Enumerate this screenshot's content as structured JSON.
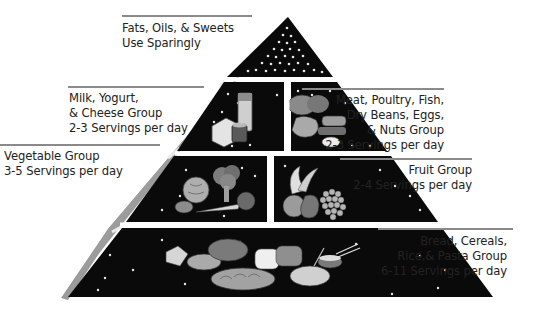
{
  "colors": {
    "tier_fill": "#0a0a0a",
    "side_face": "#9a9a9a",
    "divider": "#e9e9e9",
    "rule_line": "#8a8a8a",
    "text": "#222222",
    "speckle": "#e8e8e8"
  },
  "groups": [
    {
      "id": "fats",
      "tier": 1,
      "side": "left",
      "lines": [
        "Fats, Oils, & Sweets",
        "Use Sparingly"
      ]
    },
    {
      "id": "milk",
      "tier": 2,
      "side": "left",
      "lines": [
        "Milk, Yogurt,",
        "& Cheese Group",
        "2-3 Servings per day"
      ],
      "servings": "2-3"
    },
    {
      "id": "meat",
      "tier": 2,
      "side": "right",
      "lines": [
        "Meat, Poultry, Fish,",
        "Dry Beans, Eggs,",
        "& Nuts Group",
        "2-3 Servings per day"
      ],
      "servings": "2-3"
    },
    {
      "id": "vegetable",
      "tier": 3,
      "side": "left",
      "lines": [
        "Vegetable Group",
        "3-5 Servings per day"
      ],
      "servings": "3-5"
    },
    {
      "id": "fruit",
      "tier": 3,
      "side": "right",
      "lines": [
        "Fruit Group",
        "2-4 Servings per day"
      ],
      "servings": "2-4"
    },
    {
      "id": "bread",
      "tier": 4,
      "side": "right",
      "lines": [
        "Bread, Cereals,",
        "Rice,& Pasta Group",
        "6-11 Servings per day"
      ],
      "servings": "6-11"
    }
  ],
  "illustrations": {
    "fats": "speckle-pattern",
    "milk": "milk-carton-cheese-yogurt-cup",
    "meat": "roast-poultry-beans-fish-egg",
    "vegetable": "cabbage-broccoli-potato-carrot-tomato",
    "fruit": "banana-apple-pear-grapes",
    "bread": "crackers-cereal-bread-loaves-pasta-rice-bowl"
  }
}
